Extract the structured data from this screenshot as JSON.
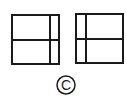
{
  "diagram": {
    "caption": "C",
    "stroke_color": "#1a1a1a",
    "background": "#ffffff",
    "panels": [
      {
        "name": "left-window",
        "rect": {
          "x": 12,
          "y": 15,
          "w": 47,
          "h": 49
        },
        "horizontal_divider_y": 40,
        "vertical_divider_x": 50
      },
      {
        "name": "right-window",
        "rect": {
          "x": 76,
          "y": 14,
          "w": 47,
          "h": 49
        },
        "horizontal_divider_y": 39,
        "vertical_divider_x": 86
      }
    ]
  }
}
